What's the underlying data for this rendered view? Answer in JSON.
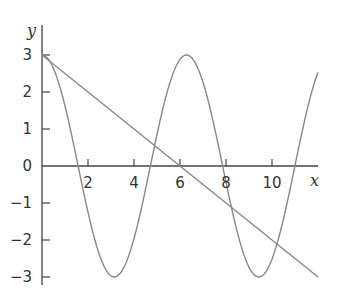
{
  "chart_data": {
    "type": "line",
    "title": "",
    "xlabel": "x",
    "ylabel": "y",
    "xlim": [
      0,
      12
    ],
    "ylim": [
      -3,
      3
    ],
    "grid": false,
    "legend": "none",
    "x_ticks": [
      "2",
      "4",
      "6",
      "8",
      "10"
    ],
    "y_ticks": [
      "3",
      "2",
      "1",
      "0",
      "-1",
      "-2",
      "-3"
    ],
    "series": [
      {
        "name": "3cos(x)",
        "function": "3*cos(x)",
        "x": [
          0,
          1.57,
          3.14,
          4.71,
          6.28,
          7.85,
          9.42,
          11,
          12
        ],
        "values": [
          3,
          0,
          -3,
          0,
          3,
          0,
          -3,
          0.01,
          2.53
        ]
      },
      {
        "name": "3 - x/2",
        "function": "3 - x/2",
        "x": [
          0,
          6,
          12
        ],
        "values": [
          3,
          0,
          -3
        ]
      }
    ],
    "colors": {
      "axis": "#444444",
      "curve": "#888888",
      "line": "#888888"
    }
  }
}
